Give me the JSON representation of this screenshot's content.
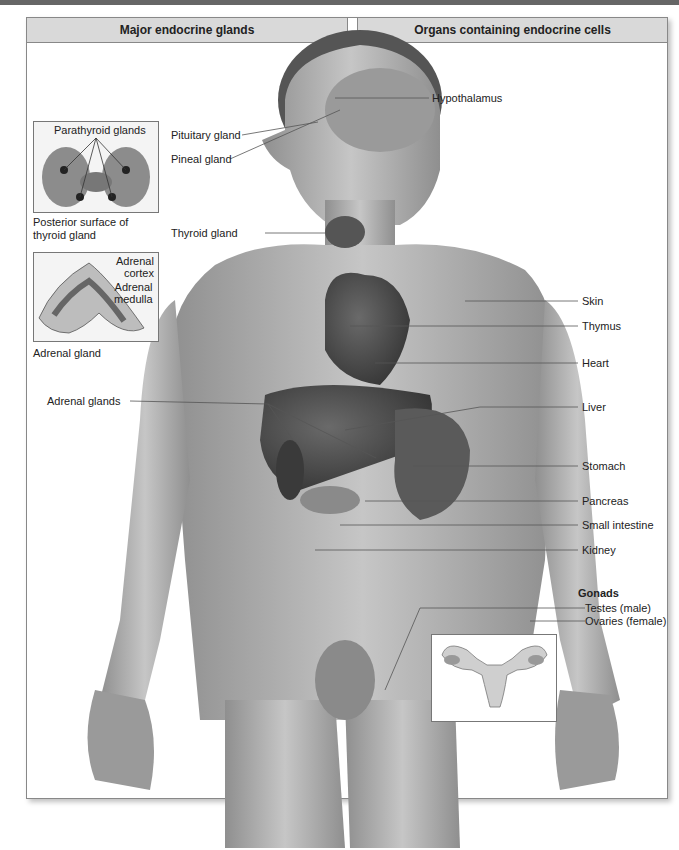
{
  "header": {
    "left_panel_title": "Major endocrine glands",
    "right_panel_title": "Organs containing endocrine cells"
  },
  "insets": {
    "thyroid": {
      "label": "Parathyroid glands",
      "caption_line1": "Posterior surface of",
      "caption_line2": "thyroid gland"
    },
    "adrenal": {
      "label_cortex_1": "Adrenal",
      "label_cortex_2": "cortex",
      "label_medulla_1": "Adrenal",
      "label_medulla_2": "medulla",
      "caption": "Adrenal gland"
    }
  },
  "left_labels": {
    "pituitary": "Pituitary gland",
    "pineal": "Pineal gland",
    "thyroid": "Thyroid gland",
    "adrenal_glands": "Adrenal glands"
  },
  "right_labels": {
    "hypothalamus": "Hypothalamus",
    "skin": "Skin",
    "thymus": "Thymus",
    "heart": "Heart",
    "liver": "Liver",
    "stomach": "Stomach",
    "pancreas": "Pancreas",
    "small_intestine": "Small intestine",
    "kidney": "Kidney"
  },
  "gonads": {
    "title": "Gonads",
    "testes": "Testes (male)",
    "ovaries": "Ovaries (female)"
  },
  "colors": {
    "header_bg": "#d9d9d9",
    "skin_tone": "#b3b3b3",
    "organ_dark": "#4a4a4a",
    "leader_line": "#555555"
  }
}
